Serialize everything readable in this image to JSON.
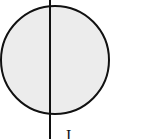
{
  "diagram": {
    "circle": {
      "cx": 55,
      "cy": 60,
      "r": 54,
      "fill": "#ececec",
      "stroke": "#111111"
    },
    "line": {
      "x": 50,
      "y1": 0,
      "y2": 139,
      "stroke": "#111111"
    },
    "caption": "I       ."
  }
}
